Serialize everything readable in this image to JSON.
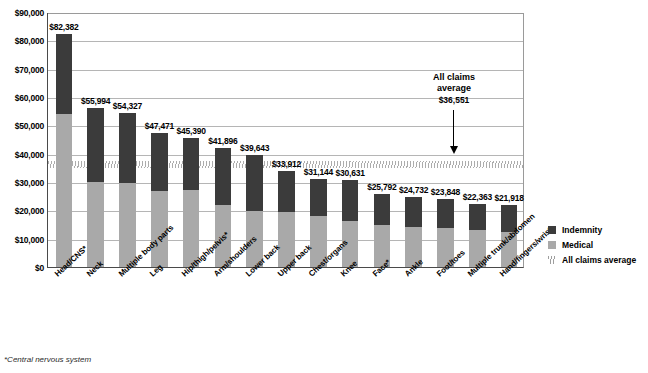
{
  "chart_data": {
    "type": "bar",
    "subtype": "stacked-vertical",
    "title": "",
    "xlabel": "",
    "ylabel": "",
    "ylim": [
      0,
      90000
    ],
    "ytick_step": 10000,
    "ytick_labels": [
      "$90,000",
      "$80,000",
      "$70,000",
      "$60,000",
      "$50,000",
      "$40,000",
      "$30,000",
      "$20,000",
      "$10,000",
      "$0"
    ],
    "ytick_values": [
      90000,
      80000,
      70000,
      60000,
      50000,
      40000,
      30000,
      20000,
      10000,
      0
    ],
    "grid": true,
    "legend_position": "right",
    "categories": [
      "Head/CNS*",
      "Neck",
      "Multiple body parts",
      "Leg",
      "Hip/thigh/pelvis*",
      "Arm/shoulders",
      "Lower back",
      "Upper back",
      "Chest/organs",
      "Knee",
      "Face*",
      "Ankle",
      "Foot/toes",
      "Multiple trunk/abdomen",
      "Hand/fingers/wrist"
    ],
    "series": [
      {
        "name": "Medical",
        "color": "#a9a9a9",
        "values": [
          54000,
          30000,
          29500,
          27000,
          27200,
          22000,
          19800,
          19400,
          17900,
          16100,
          15000,
          14200,
          13700,
          13200,
          12300
        ]
      },
      {
        "name": "Indemnity",
        "color": "#3b3b3b",
        "values": [
          28382,
          25994,
          24827,
          20471,
          18190,
          19896,
          19843,
          14512,
          13244,
          14531,
          10792,
          10532,
          10148,
          9163,
          9618
        ]
      }
    ],
    "totals": [
      82382,
      55994,
      54327,
      47471,
      45390,
      41896,
      39643,
      33912,
      31144,
      30631,
      25792,
      24732,
      23848,
      22363,
      21918
    ],
    "total_labels": [
      "$82,382",
      "$55,994",
      "$54,327",
      "$47,471",
      "$45,390",
      "$41,896",
      "$39,643",
      "$33,912",
      "$31,144",
      "$30,631",
      "$25,792",
      "$24,732",
      "$23,848",
      "$22,363",
      "$21,918"
    ],
    "reference_line": {
      "label": "All claims average",
      "value": 36551,
      "value_label": "$36,551",
      "style": "hatched-band",
      "color": "#9e9e9e"
    },
    "legend": [
      {
        "label": "Indemnity",
        "swatch": "indemnity"
      },
      {
        "label": "Medical",
        "swatch": "medical"
      },
      {
        "label": "All claims average",
        "swatch": "average"
      }
    ]
  },
  "annotation": {
    "line1": "All claims",
    "line2": "average",
    "value": "$36,551"
  },
  "footnote": {
    "text": "*Central nervous system"
  },
  "icons": {
    "down_arrow": "down-arrow-icon"
  }
}
